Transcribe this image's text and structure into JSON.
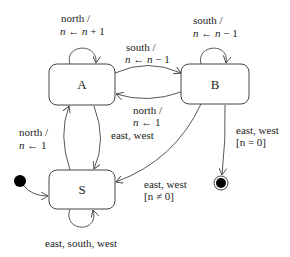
{
  "diagram": {
    "type": "state-machine",
    "states": [
      {
        "id": "A",
        "label": "A"
      },
      {
        "id": "B",
        "label": "B"
      },
      {
        "id": "S",
        "label": "S"
      }
    ],
    "initial": {
      "to": "S"
    },
    "final": {
      "from": "B"
    },
    "transitions": {
      "a_self": {
        "line1": "north /",
        "var": "n",
        "arrow": "←",
        "expr": "n + 1"
      },
      "b_self": {
        "line1": "south /",
        "var": "n",
        "arrow": "←",
        "expr": "n − 1"
      },
      "a_to_b": {
        "line1": "south /",
        "var": "n",
        "arrow": "←",
        "expr": "n − 1"
      },
      "b_to_a": {
        "line1": "north /",
        "var": "n",
        "arrow": "←",
        "expr": "1"
      },
      "s_to_a": {
        "line1": "north /",
        "var": "n",
        "arrow": "←",
        "expr": "1"
      },
      "a_to_s": {
        "line1": "east, west"
      },
      "b_to_s": {
        "line1": "east, west",
        "guard": "[n ≠ 0]"
      },
      "b_to_final": {
        "line1": "east, west",
        "guard": "[n = 0]"
      },
      "s_self": {
        "line1": "east, south, west"
      }
    }
  }
}
